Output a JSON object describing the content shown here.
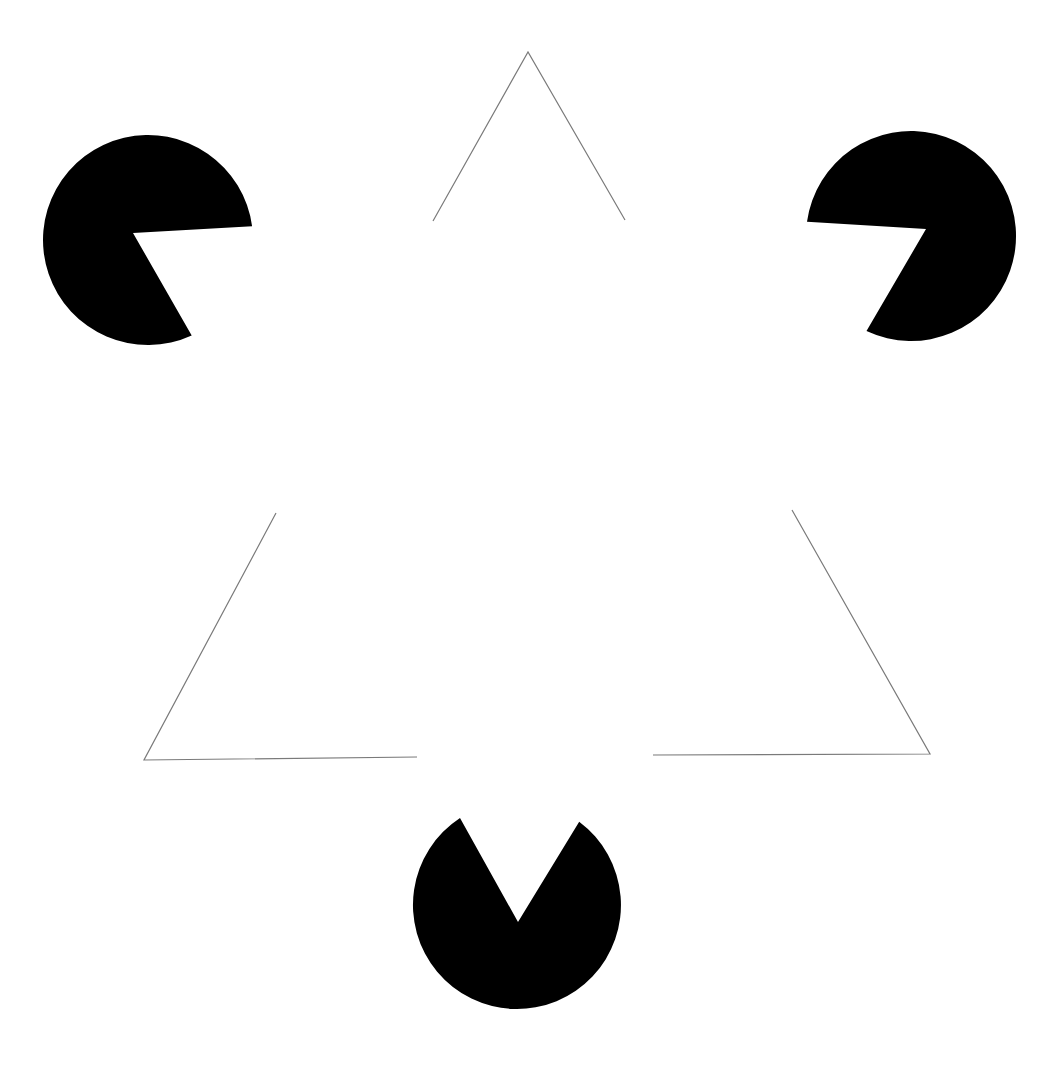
{
  "figure": {
    "background": "#ffffff",
    "fill_color": "#000000",
    "stroke_color": "#7a7a7a",
    "pacmen": [
      {
        "id": "top-left",
        "cx": 148,
        "cy": 240,
        "r": 105,
        "vertex": [
          133,
          233
        ],
        "mouth_a": [
          247,
          227
        ],
        "mouth_b": [
          191,
          334
        ]
      },
      {
        "id": "top-right",
        "cx": 911,
        "cy": 236,
        "r": 105,
        "vertex": [
          926,
          229
        ],
        "mouth_a": [
          809,
          222
        ],
        "mouth_b": [
          867,
          330
        ]
      },
      {
        "id": "bottom",
        "cx": 517,
        "cy": 905,
        "r": 104,
        "vertex": [
          518,
          922
        ],
        "mouth_a": [
          460,
          818
        ],
        "mouth_b": [
          579,
          822
        ]
      }
    ],
    "outline_corners": [
      {
        "id": "top",
        "points": [
          [
            433,
            221
          ],
          [
            528,
            52
          ],
          [
            625,
            220
          ]
        ]
      },
      {
        "id": "bottom-left",
        "points": [
          [
            276,
            513
          ],
          [
            144,
            760
          ],
          [
            417,
            757
          ]
        ]
      },
      {
        "id": "bottom-right",
        "points": [
          [
            792,
            510
          ],
          [
            930,
            754
          ],
          [
            653,
            755
          ]
        ]
      }
    ]
  }
}
